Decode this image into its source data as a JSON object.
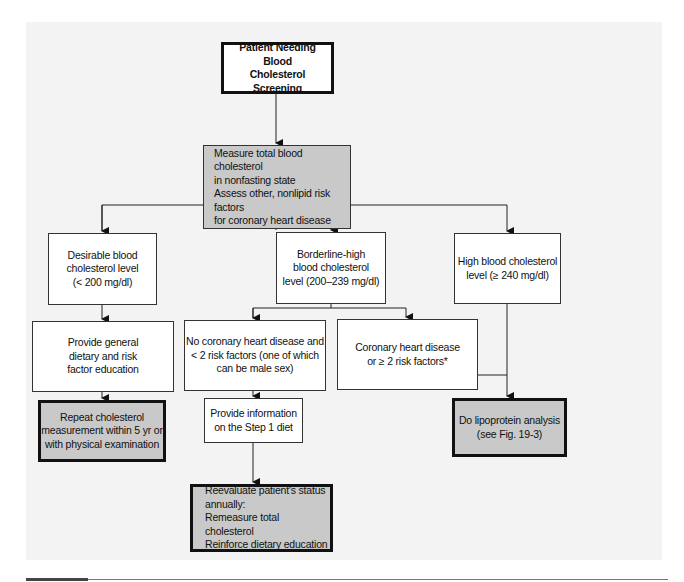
{
  "diagram": {
    "type": "flowchart",
    "colors": {
      "panel_background": "#f3f3f3",
      "box_fill_white": "#ffffff",
      "box_fill_gray": "#c9c9c9",
      "line": "#222222"
    },
    "nodes": {
      "start": {
        "text": "Patient Needing Blood\nCholesterol Screening"
      },
      "measure": {
        "text": "Measure total blood cholesterol\n   in nonfasting state\n Assess other, nonlipid risk factors\n   for coronary heart disease"
      },
      "desirable": {
        "text": "Desirable blood\ncholesterol level\n(< 200 mg/dl)"
      },
      "borderline": {
        "text": "Borderline-high\nblood cholesterol\nlevel (200–239 mg/dl)"
      },
      "high": {
        "text": "High blood cholesterol\nlevel (≥ 240 mg/dl)"
      },
      "general_education": {
        "text": "Provide general\ndietary and risk\nfactor education"
      },
      "no_chd": {
        "text": "No coronary heart disease and\n< 2 risk factors (one of which\ncan be male sex)"
      },
      "chd": {
        "text": "Coronary heart disease\nor ≥ 2 risk factors*"
      },
      "repeat": {
        "text": "Repeat cholesterol\nmeasurement within 5 yr or\nwith physical examination"
      },
      "step1": {
        "text": "Provide information\non the Step 1 diet"
      },
      "lipoprotein": {
        "text": "Do  lipoprotein analysis\n(see Fig. 19-3)"
      },
      "reevaluate": {
        "text": "Reevaluate patient's status\nannually:\n    Remeasure total cholesterol\n    Reinforce dietary education"
      }
    },
    "edges": [
      [
        "start",
        "measure"
      ],
      [
        "measure",
        "desirable"
      ],
      [
        "measure",
        "borderline"
      ],
      [
        "measure",
        "high"
      ],
      [
        "desirable",
        "general_education"
      ],
      [
        "borderline",
        "no_chd"
      ],
      [
        "borderline",
        "chd"
      ],
      [
        "general_education",
        "repeat"
      ],
      [
        "no_chd",
        "step1"
      ],
      [
        "chd",
        "lipoprotein"
      ],
      [
        "high",
        "lipoprotein"
      ],
      [
        "step1",
        "reevaluate"
      ]
    ]
  }
}
